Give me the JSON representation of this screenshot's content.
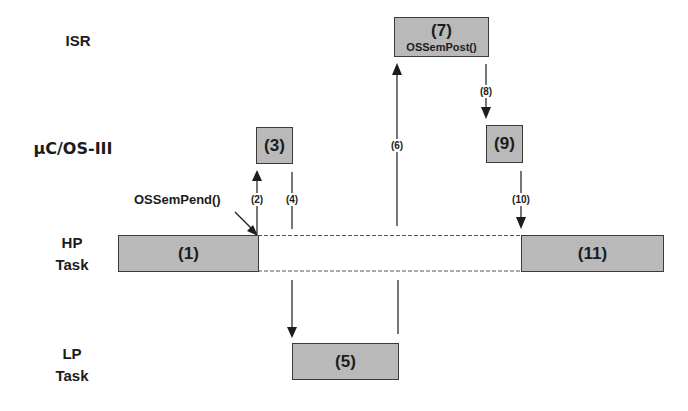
{
  "rows": {
    "isr": "ISR",
    "kernel": "µC/OS-III",
    "hp_task_line1": "HP",
    "hp_task_line2": "Task",
    "lp_task_line1": "LP",
    "lp_task_line2": "Task"
  },
  "boxes": {
    "b1": "(1)",
    "b3": "(3)",
    "b5": "(5)",
    "b7": "(7)",
    "b7_sub": "OSSemPost()",
    "b9": "(9)",
    "b11": "(11)"
  },
  "steps": {
    "s2": "(2)",
    "s4": "(4)",
    "s6": "(6)",
    "s8": "(8)",
    "s10": "(10)"
  },
  "calls": {
    "pend": "OSSemPend()"
  },
  "colors": {
    "box_fill": "#b9b9b9",
    "box_border": "#3a3a3a",
    "line": "#1c1c1c",
    "dashed": "#555555"
  }
}
